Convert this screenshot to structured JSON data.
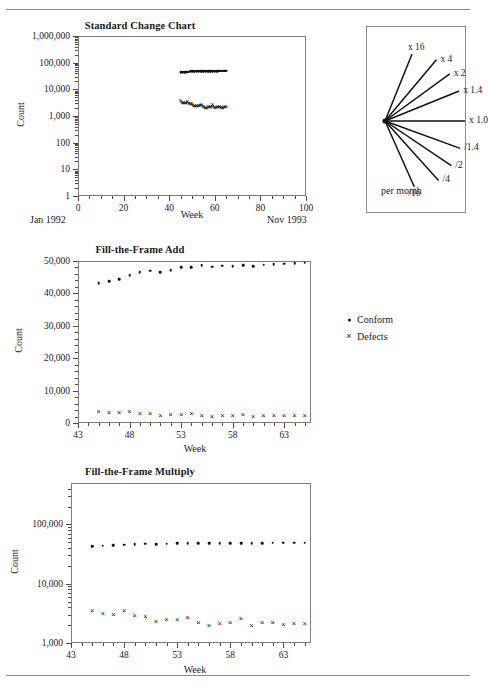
{
  "document": {
    "top_rule": true,
    "bottom_rule": true
  },
  "series_legend": {
    "items": [
      {
        "marker": "dot",
        "label": "Conform"
      },
      {
        "marker": "cross",
        "label": "Defects"
      }
    ]
  },
  "fan_legend": {
    "labels": [
      "x 16",
      "x 4",
      "x 2",
      "x 1.4",
      "x 1.0",
      "/1.4",
      "/2",
      "/4",
      "/16"
    ],
    "footer": "per month"
  },
  "chart_data": [
    {
      "id": "standard-change-chart",
      "type": "scatter",
      "title": "Standard Change Chart",
      "xlabel": "Week",
      "ylabel": "Count",
      "yscale": "log",
      "ylim": [
        1,
        1000000
      ],
      "ytick_labels": [
        "1,000,000",
        "100,000",
        "10,000",
        "1,000",
        "100",
        "10",
        "1"
      ],
      "ytick_values": [
        1000000,
        100000,
        10000,
        1000,
        100,
        10,
        1
      ],
      "xlim": [
        0,
        100
      ],
      "xtick_labels": [
        "0",
        "20",
        "40",
        "60",
        "80",
        "100"
      ],
      "xtick_values": [
        0,
        20,
        40,
        60,
        80,
        100
      ],
      "xminor_step": 5,
      "left_note": "Jan 1992",
      "right_note": "Nov 1993",
      "grid": false,
      "series": [
        {
          "name": "Conform",
          "marker": "dot",
          "x": [
            45,
            46,
            47,
            48,
            49,
            50,
            51,
            52,
            53,
            54,
            55,
            56,
            57,
            58,
            59,
            60,
            61,
            62,
            63,
            64,
            65
          ],
          "y": [
            43100,
            43800,
            44400,
            45600,
            46500,
            47000,
            46600,
            47100,
            48000,
            48100,
            48700,
            48300,
            48500,
            48400,
            48700,
            48400,
            48800,
            49100,
            49200,
            49400,
            49500
          ]
        },
        {
          "name": "Defects",
          "marker": "cross",
          "x": [
            45,
            46,
            47,
            48,
            49,
            50,
            51,
            52,
            53,
            54,
            55,
            56,
            57,
            58,
            59,
            60,
            61,
            62,
            63,
            64,
            65
          ],
          "y": [
            3500,
            3050,
            2950,
            3400,
            2800,
            2750,
            2300,
            2400,
            2450,
            2650,
            2200,
            1950,
            2100,
            2150,
            2500,
            1950,
            2200,
            2150,
            2050,
            2100,
            2100
          ]
        }
      ]
    },
    {
      "id": "fill-the-frame-add",
      "type": "scatter",
      "title": "Fill-the-Frame Add",
      "xlabel": "Week",
      "ylabel": "Count",
      "yscale": "linear",
      "ylim": [
        0,
        50000
      ],
      "ytick_labels": [
        "0",
        "10,000",
        "20,000",
        "30,000",
        "40,000",
        "50,000"
      ],
      "ytick_values": [
        0,
        10000,
        20000,
        30000,
        40000,
        50000
      ],
      "xlim": [
        43,
        65.6
      ],
      "xtick_labels": [
        "43",
        "48",
        "53",
        "58",
        "63"
      ],
      "xtick_values": [
        43,
        48,
        53,
        58,
        63
      ],
      "xminor_step": 1,
      "grid": false,
      "series": [
        {
          "name": "Conform",
          "marker": "dot",
          "x": [
            45,
            46,
            47,
            48,
            49,
            50,
            51,
            52,
            53,
            54,
            55,
            56,
            57,
            58,
            59,
            60,
            61,
            62,
            63,
            64,
            65
          ],
          "y": [
            43100,
            43800,
            44400,
            45600,
            46500,
            47000,
            46600,
            47100,
            48000,
            48100,
            48700,
            48300,
            48500,
            48400,
            48700,
            48400,
            48800,
            49100,
            49200,
            49400,
            49500
          ]
        },
        {
          "name": "Defects",
          "marker": "cross",
          "x": [
            45,
            46,
            47,
            48,
            49,
            50,
            51,
            52,
            53,
            54,
            55,
            56,
            57,
            58,
            59,
            60,
            61,
            62,
            63,
            64,
            65
          ],
          "y": [
            3500,
            3050,
            2950,
            3400,
            2800,
            2750,
            2300,
            2400,
            2450,
            2650,
            2200,
            1950,
            2100,
            2150,
            2500,
            1950,
            2200,
            2150,
            2050,
            2100,
            2100
          ]
        }
      ]
    },
    {
      "id": "fill-the-frame-multiply",
      "type": "scatter",
      "title": "Fill-the-Frame Multiply",
      "xlabel": "Week",
      "ylabel": "Count",
      "yscale": "log",
      "ylim": [
        1000,
        500000
      ],
      "ytick_labels": [
        "1,000",
        "10,000",
        "100,000"
      ],
      "ytick_values": [
        1000,
        10000,
        100000
      ],
      "xlim": [
        43,
        65.6
      ],
      "xtick_labels": [
        "43",
        "48",
        "53",
        "58",
        "63"
      ],
      "xtick_values": [
        43,
        48,
        53,
        58,
        63
      ],
      "xminor_step": 1,
      "grid": false,
      "series": [
        {
          "name": "Conform",
          "marker": "dot",
          "x": [
            45,
            46,
            47,
            48,
            49,
            50,
            51,
            52,
            53,
            54,
            55,
            56,
            57,
            58,
            59,
            60,
            61,
            62,
            63,
            64,
            65
          ],
          "y": [
            43100,
            43800,
            44400,
            45600,
            46500,
            47000,
            46600,
            47100,
            48000,
            48100,
            48700,
            48300,
            48500,
            48400,
            48700,
            48400,
            48800,
            49100,
            49200,
            49400,
            49500
          ]
        },
        {
          "name": "Defects",
          "marker": "cross",
          "x": [
            45,
            46,
            47,
            48,
            49,
            50,
            51,
            52,
            53,
            54,
            55,
            56,
            57,
            58,
            59,
            60,
            61,
            62,
            63,
            64,
            65
          ],
          "y": [
            3500,
            3050,
            2950,
            3400,
            2800,
            2750,
            2300,
            2400,
            2450,
            2650,
            2200,
            1950,
            2100,
            2150,
            2500,
            1950,
            2200,
            2150,
            2050,
            2100,
            2100
          ]
        }
      ]
    }
  ]
}
